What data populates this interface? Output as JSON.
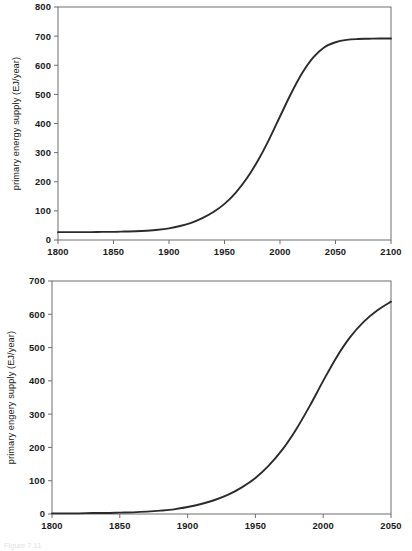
{
  "document": {
    "caption_fragment": "Figure 7.11"
  },
  "colors": {
    "curve": "#2b2b2b",
    "frame": "#6f6f6f",
    "text": "#1a1a1a",
    "background": "#ffffff"
  },
  "chart_data": [
    {
      "id": "top",
      "type": "line",
      "title": "",
      "xlabel": "",
      "ylabel": "primary energy supply (EJ/year)",
      "xlim": [
        1800,
        2100
      ],
      "ylim": [
        0,
        800
      ],
      "grid": false,
      "legend": "none",
      "xticks": [
        1800,
        1850,
        1900,
        1950,
        2000,
        2050,
        2100
      ],
      "yticks": [
        0,
        100,
        200,
        300,
        400,
        500,
        600,
        700,
        800
      ],
      "xtick_labels": [
        "1800",
        "1850",
        "1900",
        "1950",
        "2000",
        "2050",
        "2100"
      ],
      "ytick_labels": [
        "0",
        "100",
        "200",
        "300",
        "400",
        "500",
        "600",
        "700",
        "800"
      ],
      "series": [
        {
          "name": "primary energy supply",
          "x": [
            1800,
            1810,
            1820,
            1830,
            1840,
            1850,
            1860,
            1870,
            1880,
            1890,
            1900,
            1910,
            1920,
            1930,
            1940,
            1950,
            1960,
            1970,
            1980,
            1990,
            2000,
            2010,
            2020,
            2030,
            2040,
            2050,
            2060,
            2070,
            2080,
            2090,
            2100
          ],
          "y": [
            27,
            27,
            27,
            27,
            28,
            28,
            29,
            30,
            32,
            35,
            40,
            48,
            59,
            75,
            96,
            124,
            162,
            211,
            272,
            344,
            424,
            503,
            573,
            627,
            662,
            679,
            687,
            690,
            691,
            692,
            692
          ]
        }
      ],
      "annotations": {
        "start_value": 27,
        "plateau_value": 690,
        "inflection_year": 1985
      }
    },
    {
      "id": "bottom",
      "type": "line",
      "title": "",
      "xlabel": "",
      "ylabel": "primary engery supply (EJ/year)",
      "xlim": [
        1800,
        2050
      ],
      "ylim": [
        0,
        700
      ],
      "grid": false,
      "legend": "none",
      "xticks": [
        1800,
        1850,
        1900,
        1950,
        2000,
        2050
      ],
      "yticks": [
        0,
        100,
        200,
        300,
        400,
        500,
        600,
        700
      ],
      "xtick_labels": [
        "1800",
        "1850",
        "1900",
        "1950",
        "2000",
        "2050"
      ],
      "ytick_labels": [
        "0",
        "100",
        "200",
        "300",
        "400",
        "500",
        "600",
        "700"
      ],
      "series": [
        {
          "name": "primary energy supply",
          "x": [
            1800,
            1810,
            1820,
            1830,
            1840,
            1850,
            1860,
            1870,
            1880,
            1890,
            1900,
            1910,
            1920,
            1930,
            1940,
            1950,
            1960,
            1970,
            1980,
            1990,
            2000,
            2010,
            2020,
            2030,
            2040,
            2050
          ],
          "y": [
            2,
            2,
            2,
            3,
            3,
            4,
            5,
            7,
            10,
            14,
            21,
            30,
            42,
            58,
            80,
            108,
            146,
            194,
            254,
            324,
            400,
            472,
            532,
            578,
            612,
            638
          ]
        }
      ],
      "annotations": {
        "start_value": 2,
        "end_value": 638,
        "inflection_year": 2000
      }
    }
  ]
}
